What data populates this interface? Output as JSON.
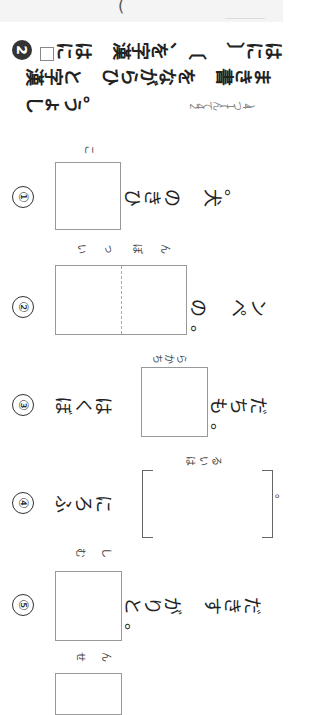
{
  "top": {
    "paren": "("
  },
  "header": {
    "number": "2",
    "line1a": "にはㅤ漢字を、〔ㅤ〕には",
    "line1_before_box": "",
    "line2": "漢字とㅤひらがなをㅤ書きま",
    "line3": "しょう。",
    "score": "24てん(1つ4)"
  },
  "questions": [
    {
      "num": "①",
      "furigana": "こ",
      "before": "",
      "after": "ひきのㅤ犬。",
      "answer_type": "box"
    },
    {
      "num": "②",
      "furigana": "いっぽん",
      "before": "",
      "after": "のㅤペン。",
      "answer_type": "double-box"
    },
    {
      "num": "③",
      "furigana": "ちから",
      "before": "ぼくは",
      "after": "もちだ。",
      "answer_type": "box"
    },
    {
      "num": "④",
      "furigana": "はいる",
      "before": "ふろに",
      "after": "。",
      "answer_type": "bracket"
    },
    {
      "num": "⑤",
      "furigana": "むし",
      "before": "",
      "after": "とりがㅤすきだ。",
      "answer_type": "box"
    },
    {
      "num": "⑥",
      "furigana": "せん",
      "before": "",
      "after": "",
      "answer_type": "box"
    }
  ]
}
